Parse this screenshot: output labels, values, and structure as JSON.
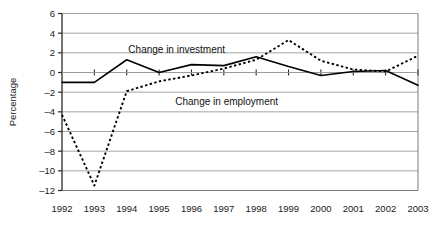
{
  "chart_data": {
    "type": "line",
    "title": "",
    "xlabel": "",
    "ylabel": "Percentage",
    "x": [
      1992,
      1993,
      1994,
      1995,
      1996,
      1997,
      1998,
      1999,
      2000,
      2001,
      2002,
      2003
    ],
    "categories": [
      "1992",
      "1993",
      "1994",
      "1995",
      "1996",
      "1997",
      "1998",
      "1999",
      "2000",
      "2001",
      "2002",
      "2003"
    ],
    "ylim": [
      -12,
      6
    ],
    "yticks": [
      6,
      4,
      2,
      0,
      -2,
      -4,
      -6,
      -8,
      -10,
      -12
    ],
    "ytick_labels": [
      "6",
      "4",
      "2",
      "0",
      "-2",
      "-4",
      "-6",
      "-8",
      "-10",
      "-12"
    ],
    "grid": "horizontal",
    "legend_position": "inline-annotations",
    "series": [
      {
        "name": "Change in investment",
        "style": "solid",
        "color": "#000000",
        "label_x": 1994.05,
        "label_y": 2.3,
        "values": [
          -1.0,
          -1.0,
          1.3,
          0.0,
          0.8,
          0.7,
          1.6,
          0.6,
          -0.3,
          0.1,
          0.2,
          -1.3
        ]
      },
      {
        "name": "Change in employment",
        "style": "dotted",
        "color": "#000000",
        "label_x": 1995.5,
        "label_y": -2.9,
        "values": [
          -4.3,
          -11.5,
          -1.9,
          -0.9,
          -0.3,
          0.4,
          1.3,
          3.3,
          1.2,
          0.3,
          0.1,
          1.7
        ]
      }
    ],
    "annotations": [
      {
        "text": "Change in investment",
        "x": 1994.05,
        "y": 2.3
      },
      {
        "text": "Change in employment",
        "x": 1995.5,
        "y": -2.9
      }
    ]
  },
  "colors": {
    "plot_border": "#7d7d7d",
    "gridline": "#9a9a9a",
    "axis": "#2b2b2b",
    "series": "#000000",
    "background": "#ffffff"
  }
}
